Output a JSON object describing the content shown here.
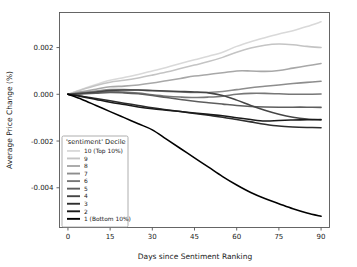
{
  "chart_data": {
    "type": "line",
    "title": "",
    "xlabel": "Days since Sentiment Ranking",
    "ylabel": "Average Price Change (%)",
    "xlim": [
      -3,
      93
    ],
    "ylim": [
      -0.0057,
      0.0035
    ],
    "xticks": [
      0,
      15,
      30,
      45,
      60,
      75,
      90
    ],
    "xticklabels": [
      "0",
      "15",
      "30",
      "45",
      "60",
      "75",
      "90"
    ],
    "yticks": [
      0.002,
      0.0,
      -0.002,
      -0.004
    ],
    "yticklabels": [
      "0.002",
      "0.000",
      "-0.002",
      "-0.004"
    ],
    "grid": false,
    "legend_position": "lower left",
    "legend_title": "'sentiment' Decile",
    "x": [
      0,
      5,
      10,
      15,
      20,
      25,
      30,
      35,
      40,
      45,
      50,
      55,
      60,
      65,
      70,
      75,
      80,
      85,
      90
    ],
    "series": [
      {
        "name": "10 (Top 10%)",
        "label": "10 (Top 10%)",
        "color": "#d9d9d9",
        "values": [
          0.0,
          0.00022,
          0.00042,
          0.0006,
          0.00072,
          0.00085,
          0.001,
          0.00115,
          0.00132,
          0.00148,
          0.00163,
          0.0018,
          0.00205,
          0.00225,
          0.00242,
          0.00258,
          0.00272,
          0.0029,
          0.0031
        ]
      },
      {
        "name": "9",
        "label": "9",
        "color": "#c4c4c4",
        "values": [
          0.0,
          0.0002,
          0.00038,
          0.00052,
          0.0006,
          0.0007,
          0.00082,
          0.00095,
          0.0011,
          0.00125,
          0.0014,
          0.00158,
          0.0018,
          0.00198,
          0.0021,
          0.00215,
          0.00212,
          0.00205,
          0.002
        ]
      },
      {
        "name": "8",
        "label": "8",
        "color": "#a8a8a8",
        "values": [
          0.0,
          0.00012,
          0.00022,
          0.00032,
          0.00035,
          0.0004,
          0.00048,
          0.00058,
          0.00068,
          0.00078,
          0.00085,
          0.00092,
          0.001,
          0.001,
          0.00098,
          0.00102,
          0.00112,
          0.00122,
          0.00132
        ]
      },
      {
        "name": "7",
        "label": "7",
        "color": "#8d8d8d",
        "values": [
          0.0,
          8e-05,
          0.00014,
          0.0002,
          0.0002,
          0.00018,
          0.00015,
          0.00012,
          0.0001,
          8e-05,
          8e-05,
          0.00012,
          0.0002,
          0.00028,
          0.00034,
          0.0004,
          0.00046,
          0.00051,
          0.00056
        ]
      },
      {
        "name": "6",
        "label": "6",
        "color": "#777777",
        "values": [
          0.0,
          4e-05,
          8e-05,
          0.00012,
          0.0001,
          5e-05,
          -2e-05,
          -8e-05,
          -0.00012,
          -0.00014,
          -0.00012,
          -8e-05,
          0.0,
          4e-05,
          4e-05,
          2e-05,
          0.0,
          0.0,
          1e-05
        ]
      },
      {
        "name": "5",
        "label": "5",
        "color": "#5e5e5e",
        "values": [
          0.0,
          2e-05,
          5e-05,
          8e-05,
          6e-05,
          2e-05,
          -5e-05,
          -0.00014,
          -0.00022,
          -0.0003,
          -0.00036,
          -0.00042,
          -0.00048,
          -0.00052,
          -0.00054,
          -0.00055,
          -0.00055,
          -0.00055,
          -0.00056
        ]
      },
      {
        "name": "4",
        "label": "4",
        "color": "#454545",
        "values": [
          0.0,
          4e-05,
          0.0001,
          0.00016,
          0.00018,
          0.00018,
          0.00016,
          0.00014,
          0.00012,
          0.0001,
          6e-05,
          -5e-05,
          -0.00025,
          -0.00048,
          -0.00068,
          -0.00085,
          -0.00098,
          -0.00106,
          -0.0011
        ]
      },
      {
        "name": "3",
        "label": "3",
        "color": "#2e2e2e",
        "values": [
          0.0,
          -8e-05,
          -0.00018,
          -0.00028,
          -0.00038,
          -0.00048,
          -0.00058,
          -0.00066,
          -0.00074,
          -0.00082,
          -0.0009,
          -0.00098,
          -0.00108,
          -0.00118,
          -0.00128,
          -0.00136,
          -0.0014,
          -0.00142,
          -0.00143
        ]
      },
      {
        "name": "2",
        "label": "2",
        "color": "#1a1a1a",
        "values": [
          0.0,
          -0.0001,
          -0.00022,
          -0.00034,
          -0.00044,
          -0.00054,
          -0.00062,
          -0.00068,
          -0.00074,
          -0.0008,
          -0.00086,
          -0.00092,
          -0.001,
          -0.00108,
          -0.00114,
          -0.00112,
          -0.0011,
          -0.00109,
          -0.00108
        ]
      },
      {
        "name": "1 (Bottom 10%)",
        "label": "1 (Bottom 10%)",
        "color": "#000000",
        "values": [
          0.0,
          -0.00022,
          -0.00048,
          -0.00074,
          -0.001,
          -0.00126,
          -0.00152,
          -0.00192,
          -0.00232,
          -0.00272,
          -0.00312,
          -0.00352,
          -0.00388,
          -0.0042,
          -0.00446,
          -0.00468,
          -0.0049,
          -0.00508,
          -0.00522
        ]
      }
    ]
  }
}
